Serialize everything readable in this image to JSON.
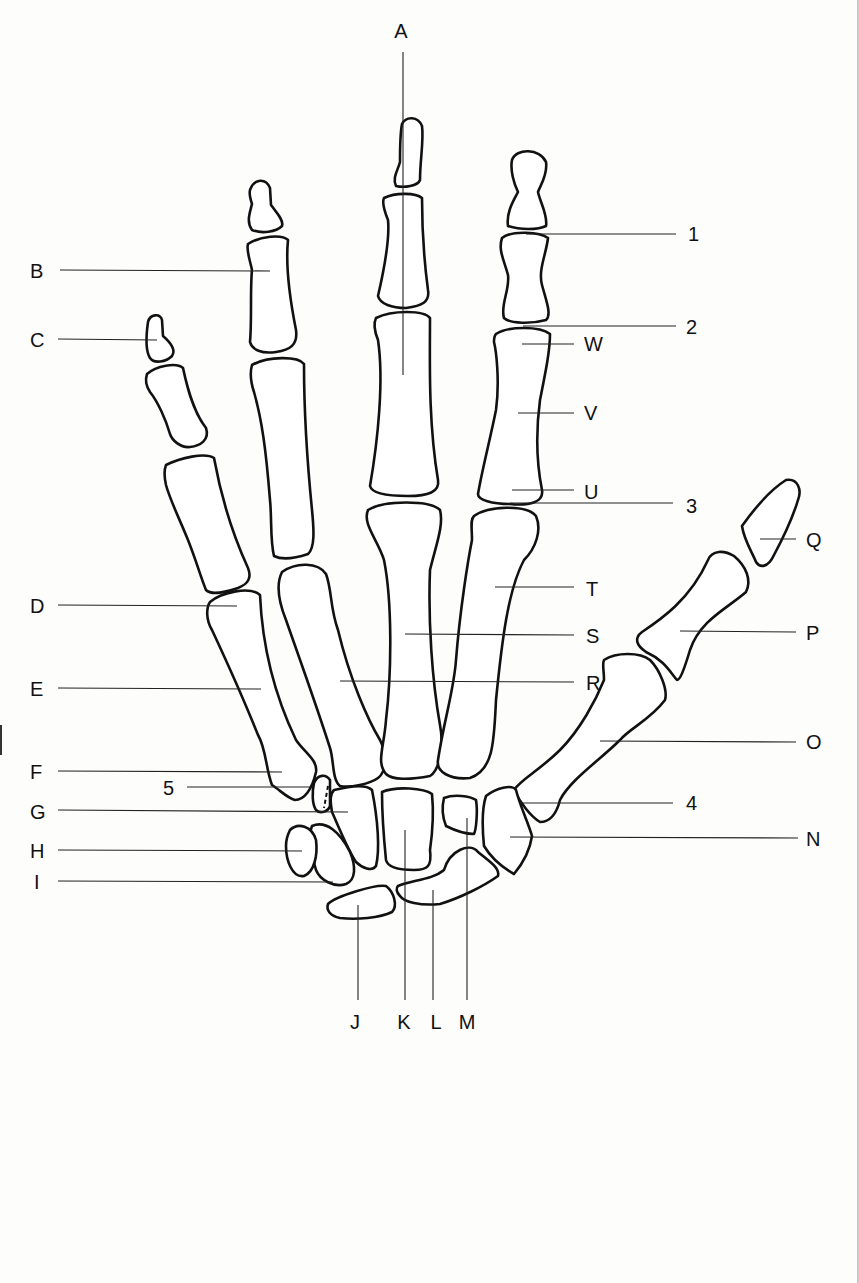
{
  "figure": {
    "colors": {
      "outline": "#111111",
      "leader": "#222222",
      "background": "#fdfdfc"
    }
  },
  "labels": [
    {
      "id": "A",
      "text": "A",
      "x": 401,
      "y": 38,
      "anchor": "middle",
      "line": [
        403,
        52,
        403,
        375
      ]
    },
    {
      "id": "B",
      "text": "B",
      "x": 30,
      "y": 278,
      "anchor": "start",
      "line": [
        60,
        270,
        270,
        271
      ]
    },
    {
      "id": "C",
      "text": "C",
      "x": 30,
      "y": 347,
      "anchor": "start",
      "line": [
        58,
        339,
        157,
        340
      ]
    },
    {
      "id": "D",
      "text": "D",
      "x": 30,
      "y": 613,
      "anchor": "start",
      "line": [
        58,
        605,
        237,
        606
      ]
    },
    {
      "id": "E",
      "text": "E",
      "x": 30,
      "y": 696,
      "anchor": "start",
      "line": [
        58,
        688,
        261,
        689
      ]
    },
    {
      "id": "F",
      "text": "F",
      "x": 30,
      "y": 779,
      "anchor": "start",
      "line": [
        58,
        771,
        282,
        772
      ]
    },
    {
      "id": "five",
      "text": "5",
      "x": 163,
      "y": 795,
      "anchor": "start",
      "line": [
        187,
        787,
        310,
        787
      ]
    },
    {
      "id": "G",
      "text": "G",
      "x": 30,
      "y": 819,
      "anchor": "start",
      "line": [
        58,
        810,
        348,
        812
      ]
    },
    {
      "id": "H",
      "text": "H",
      "x": 30,
      "y": 858,
      "anchor": "start",
      "line": [
        58,
        850,
        302,
        851
      ]
    },
    {
      "id": "I",
      "text": "I",
      "x": 34,
      "y": 889,
      "anchor": "start",
      "line": [
        58,
        881,
        333,
        882
      ]
    },
    {
      "id": "J",
      "text": "J",
      "x": 355,
      "y": 1029,
      "anchor": "middle",
      "line": [
        358,
        905,
        358,
        1000
      ]
    },
    {
      "id": "K",
      "text": "K",
      "x": 404,
      "y": 1029,
      "anchor": "middle",
      "line": [
        405,
        830,
        405,
        1000
      ]
    },
    {
      "id": "L",
      "text": "L",
      "x": 436,
      "y": 1029,
      "anchor": "middle",
      "line": [
        433,
        890,
        433,
        1000
      ]
    },
    {
      "id": "M",
      "text": "M",
      "x": 467,
      "y": 1029,
      "anchor": "middle",
      "line": [
        467,
        818,
        467,
        1000
      ]
    },
    {
      "id": "N",
      "text": "N",
      "x": 806,
      "y": 846,
      "anchor": "start",
      "line": [
        510,
        837,
        798,
        838
      ]
    },
    {
      "id": "four",
      "text": "4",
      "x": 686,
      "y": 810,
      "anchor": "start",
      "line": [
        520,
        803,
        673,
        803
      ]
    },
    {
      "id": "O",
      "text": "O",
      "x": 806,
      "y": 749,
      "anchor": "start",
      "line": [
        600,
        741,
        796,
        742
      ]
    },
    {
      "id": "P",
      "text": "P",
      "x": 806,
      "y": 640,
      "anchor": "start",
      "line": [
        680,
        631,
        796,
        632
      ]
    },
    {
      "id": "Q",
      "text": "Q",
      "x": 806,
      "y": 547,
      "anchor": "start",
      "line": [
        760,
        539,
        796,
        539
      ]
    },
    {
      "id": "R",
      "text": "R",
      "x": 586,
      "y": 690,
      "anchor": "start",
      "line": [
        340,
        681,
        574,
        682
      ]
    },
    {
      "id": "S",
      "text": "S",
      "x": 586,
      "y": 643,
      "anchor": "start",
      "line": [
        405,
        634,
        574,
        635
      ]
    },
    {
      "id": "T",
      "text": "T",
      "x": 586,
      "y": 596,
      "anchor": "start",
      "line": [
        495,
        587,
        574,
        587
      ]
    },
    {
      "id": "three",
      "text": "3",
      "x": 686,
      "y": 513,
      "anchor": "start",
      "line": [
        510,
        503,
        673,
        503
      ]
    },
    {
      "id": "U",
      "text": "U",
      "x": 584,
      "y": 499,
      "anchor": "start",
      "line": [
        512,
        490,
        574,
        490
      ]
    },
    {
      "id": "V",
      "text": "V",
      "x": 584,
      "y": 420,
      "anchor": "start",
      "line": [
        518,
        413,
        574,
        413
      ]
    },
    {
      "id": "W",
      "text": "W",
      "x": 584,
      "y": 351,
      "anchor": "start",
      "line": [
        522,
        344,
        574,
        344
      ]
    },
    {
      "id": "two",
      "text": "2",
      "x": 686,
      "y": 334,
      "anchor": "start",
      "line": [
        523,
        326,
        676,
        326
      ]
    },
    {
      "id": "one",
      "text": "1",
      "x": 688,
      "y": 241,
      "anchor": "start",
      "line": [
        526,
        234,
        676,
        234
      ]
    }
  ]
}
